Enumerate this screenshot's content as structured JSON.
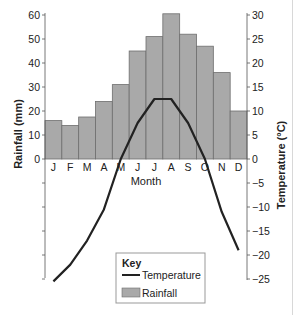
{
  "chart_data": {
    "type": "bar+line",
    "title": "",
    "xlabel": "Month",
    "ylabel_left": "Rainfall (mm)",
    "ylabel_right": "Temperature (°C)",
    "categories": [
      "J",
      "F",
      "M",
      "A",
      "M",
      "J",
      "J",
      "A",
      "S",
      "O",
      "N",
      "D"
    ],
    "series": [
      {
        "name": "Rainfall",
        "type": "bar",
        "axis": "left",
        "unit": "mm",
        "values": [
          16,
          14,
          17.5,
          24,
          31,
          45,
          51,
          60.5,
          52,
          47,
          36,
          20
        ]
      },
      {
        "name": "Temperature",
        "type": "line",
        "axis": "right",
        "unit": "°C",
        "values": [
          -25.5,
          -22,
          -17,
          -10.5,
          0,
          7.5,
          12.5,
          12.5,
          7.5,
          0,
          -11,
          -19
        ]
      }
    ],
    "ylim_left": [
      0,
      60
    ],
    "left_ticks": [
      0,
      10,
      20,
      30,
      40,
      50,
      60
    ],
    "ylim_right": [
      -25,
      30
    ],
    "right_ticks": [
      30,
      25,
      20,
      15,
      10,
      5,
      0,
      -5,
      -10,
      -15,
      -20,
      -25
    ],
    "grid": false,
    "legend": {
      "title": "Key",
      "position": "bottom-center",
      "entries": [
        {
          "label": "Temperature",
          "type": "line"
        },
        {
          "label": "Rainfall",
          "type": "bar"
        }
      ]
    }
  },
  "colors": {
    "bar_fill": "#a9a9a9",
    "bar_stroke": "#6e6e6e",
    "line": "#222222",
    "axis": "#555555",
    "text": "#222222"
  }
}
